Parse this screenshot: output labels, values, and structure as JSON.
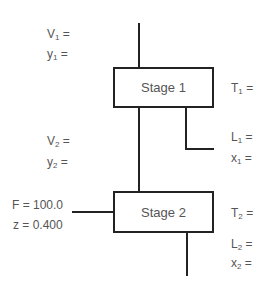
{
  "diagram": {
    "stages": [
      {
        "id": "stage-1",
        "label": "Stage 1"
      },
      {
        "id": "stage-2",
        "label": "Stage 2"
      }
    ],
    "labels": {
      "V1": {
        "base": "V",
        "sub": "1",
        "suffix": " ="
      },
      "y1": {
        "base": "y",
        "sub": "1",
        "suffix": " ="
      },
      "T1": {
        "base": "T",
        "sub": "1",
        "suffix": " ="
      },
      "V2": {
        "base": "V",
        "sub": "2",
        "suffix": " ="
      },
      "y2": {
        "base": "y",
        "sub": "2",
        "suffix": " ="
      },
      "L1": {
        "base": "L",
        "sub": "1",
        "suffix": " ="
      },
      "x1": {
        "base": "x",
        "sub": "1",
        "suffix": " ="
      },
      "T2": {
        "base": "T",
        "sub": "2",
        "suffix": " ="
      },
      "L2": {
        "base": "L",
        "sub": "2",
        "suffix": " ="
      },
      "x2": {
        "base": "x",
        "sub": "2",
        "suffix": " ="
      }
    },
    "feed": {
      "F": "F = 100.0",
      "z": "z = 0.400"
    },
    "colors": {
      "line": "#222222",
      "text": "#555555",
      "background": "#ffffff"
    }
  }
}
